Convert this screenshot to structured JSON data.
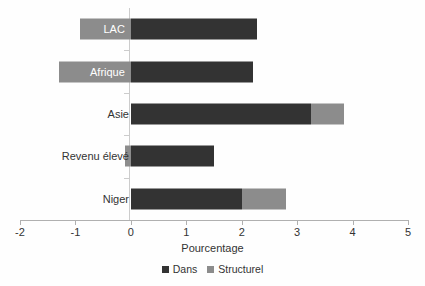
{
  "chart_data": {
    "type": "bar",
    "orientation": "horizontal",
    "stacked": true,
    "title": "",
    "xlabel": "Pourcentage",
    "ylabel": "",
    "xlim": [
      -2,
      5
    ],
    "xticks": [
      -2,
      -1,
      0,
      1,
      2,
      3,
      4,
      5
    ],
    "xtick_labels": [
      "-2",
      "-1",
      "0",
      "1",
      "2",
      "3",
      "4",
      "5"
    ],
    "grid": false,
    "legend_position": "bottom",
    "categories": [
      "LAC",
      "Afrique",
      "Asie",
      "Revenu élevé",
      "Niger"
    ],
    "series": [
      {
        "name": "Dans",
        "color": "#333333",
        "values": [
          2.27,
          2.2,
          3.25,
          1.5,
          2.0
        ]
      },
      {
        "name": "Structurel",
        "color": "#8c8c8c",
        "values": [
          -0.91,
          -1.29,
          0.6,
          -0.1,
          0.8
        ]
      }
    ],
    "bars": [
      {
        "category": "LAC",
        "label_on_bar": true,
        "segments": [
          {
            "series": "Structurel",
            "start": -0.91,
            "end": 0.0
          },
          {
            "series": "Dans",
            "start": 0.0,
            "end": 2.27
          }
        ]
      },
      {
        "category": "Afrique",
        "label_on_bar": true,
        "segments": [
          {
            "series": "Structurel",
            "start": -1.29,
            "end": 0.0
          },
          {
            "series": "Dans",
            "start": 0.0,
            "end": 2.2
          }
        ]
      },
      {
        "category": "Asie",
        "label_on_bar": false,
        "segments": [
          {
            "series": "Dans",
            "start": 0.0,
            "end": 3.25
          },
          {
            "series": "Structurel",
            "start": 3.25,
            "end": 3.85
          }
        ]
      },
      {
        "category": "Revenu élevé",
        "label_on_bar": false,
        "segments": [
          {
            "series": "Structurel",
            "start": -0.1,
            "end": 0.0
          },
          {
            "series": "Dans",
            "start": 0.0,
            "end": 1.5
          }
        ]
      },
      {
        "category": "Niger",
        "label_on_bar": false,
        "segments": [
          {
            "series": "Dans",
            "start": 0.0,
            "end": 2.0
          },
          {
            "series": "Structurel",
            "start": 2.0,
            "end": 2.8
          }
        ]
      }
    ],
    "legend": [
      {
        "label": "Dans",
        "color": "#333333"
      },
      {
        "label": "Structurel",
        "color": "#8c8c8c"
      }
    ]
  },
  "colors": {
    "dans": "#333333",
    "structurel": "#8c8c8c",
    "axis": "#b0b0b0",
    "zero_line": "#cccccc",
    "text": "#333333",
    "background": "#fefefe"
  }
}
